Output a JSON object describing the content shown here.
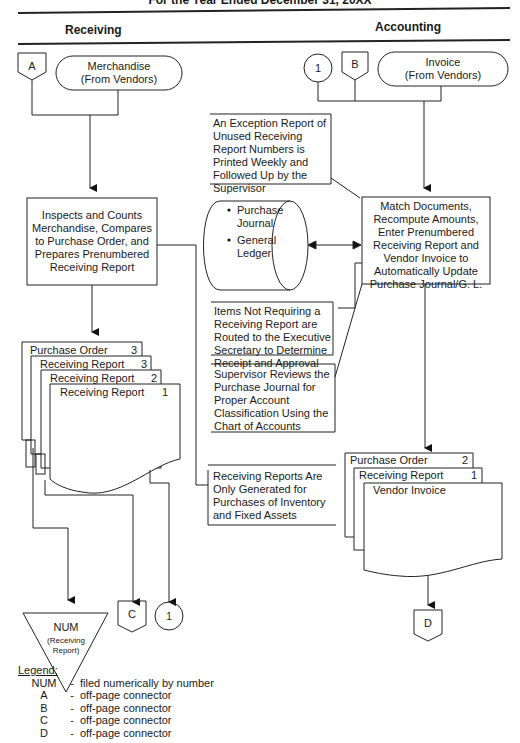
{
  "header": {
    "title_partial": "For the Year Ended December 31, 20XX",
    "columns": [
      "Receiving",
      "Accounting"
    ]
  },
  "receiving": {
    "connector_a": "A",
    "merchandise": [
      "Merchandise",
      "(From Vendors)"
    ],
    "inspect_box": [
      "Inspects and Counts",
      "Merchandise, Compares",
      "to Purchase Order, and",
      "Prepares Prenumbered",
      "Receiving Report"
    ],
    "doc_stack": [
      {
        "label": "Purchase Order",
        "copy": "3"
      },
      {
        "label": "Receiving Report",
        "copy": "3"
      },
      {
        "label": "Receiving Report",
        "copy": "2"
      },
      {
        "label": "Receiving Report",
        "copy": "1"
      }
    ],
    "num_file": {
      "label": "NUM",
      "sub": [
        "(Receiving",
        "Report)"
      ]
    },
    "connector_c": "C",
    "connector_1": "1",
    "annotation": [
      "Receiving Reports Are",
      "Only Generated for",
      "Purchases of Inventory",
      "and Fixed Assets"
    ]
  },
  "accounting": {
    "connector_1": "1",
    "connector_b": "B",
    "invoice": [
      "Invoice",
      "(From Vendors)"
    ],
    "exception_note": [
      "An Exception Report of",
      "Unused Receiving",
      "Report Numbers is",
      "Printed Weekly and",
      "Followed Up by the",
      "Supervisor"
    ],
    "database": [
      "Purchase",
      "Journal",
      "General",
      "Ledger"
    ],
    "match_box": [
      "Match Documents,",
      "Recompute Amounts,",
      "Enter Prenumbered",
      "Receiving Report and",
      "Vendor Invoice to",
      "Automatically Update",
      "Purchase Journal/G. L."
    ],
    "items_note": [
      "Items Not Requiring a",
      "Receiving Report are",
      "Routed to the Executive",
      "Secretary to Determine",
      "Receipt and Approval"
    ],
    "supervisor_note": [
      "Supervisor Reviews the",
      "Purchase Journal for",
      "Proper Account",
      "Classification Using the",
      "Chart of Accounts"
    ],
    "doc_stack": [
      {
        "label": "Purchase Order",
        "copy": "2"
      },
      {
        "label": "Receiving Report",
        "copy": "1"
      },
      {
        "label": "Vendor Invoice",
        "copy": ""
      }
    ],
    "connector_d": "D"
  },
  "legend": {
    "title": "Legend:",
    "items": [
      {
        "key": "NUM",
        "desc": "filed numerically by number"
      },
      {
        "key": "A",
        "desc": "off-page connector"
      },
      {
        "key": "B",
        "desc": "off-page connector"
      },
      {
        "key": "C",
        "desc": "off-page connector"
      },
      {
        "key": "D",
        "desc": "off-page connector"
      }
    ]
  }
}
